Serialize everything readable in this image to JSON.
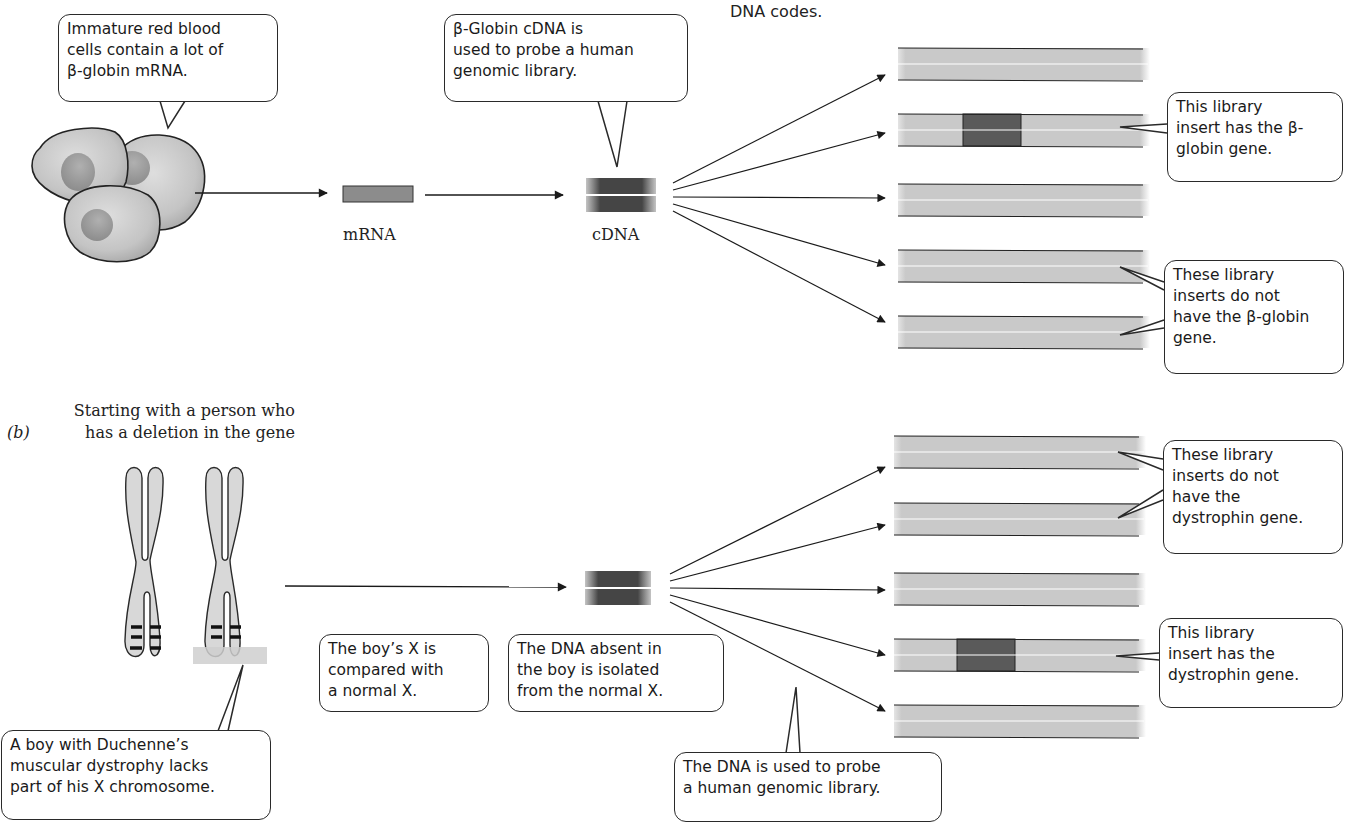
{
  "header": {
    "cut_off_text": "DNA codes."
  },
  "panel_a": {
    "callouts": {
      "red_cells": "Immature red blood\ncells contain a lot of\nβ-globin mRNA.",
      "cdna_probe": "β-Globin cDNA is\nused to probe a human\ngenomic library.",
      "has_gene": "This  library\ninsert has the β-\nglobin gene.",
      "no_gene": "These library\ninserts do not\nhave the β-globin\ngene."
    },
    "labels": {
      "mrna": "mRNA",
      "cdna": "cDNA"
    },
    "library_inserts": [
      {
        "y": 62,
        "has_gene": false
      },
      {
        "y": 130,
        "has_gene": true
      },
      {
        "y": 200,
        "has_gene": false
      },
      {
        "y": 266,
        "has_gene": false
      },
      {
        "y": 332,
        "has_gene": false
      }
    ]
  },
  "panel_b": {
    "label": "(b)",
    "title": "Starting with a person who\nhas a deletion in the gene",
    "callouts": {
      "boy": "A boy with Duchenne’s\nmuscular dystrophy lacks\npart of his X chromosome.",
      "compare": "The boy’s X is\ncompared with\na normal X.",
      "isolated": "The DNA absent in\nthe boy is isolated\nfrom the normal X.",
      "probe": "The DNA is used to probe\na human genomic library.",
      "no_gene": "These library\ninserts do not\nhave the\ndystrophin gene.",
      "has_gene": "This library\ninsert has the\ndystrophin gene."
    },
    "library_inserts": [
      {
        "y": 452,
        "has_gene": false
      },
      {
        "y": 519,
        "has_gene": false
      },
      {
        "y": 589,
        "has_gene": false
      },
      {
        "y": 655,
        "has_gene": true
      },
      {
        "y": 721,
        "has_gene": false
      }
    ]
  },
  "colors": {
    "strip_fill": "#c8c8c8",
    "gene_block": "#5a5a5a",
    "probe_dark": "#4a4a4a",
    "outline": "#2a2a2a",
    "deletion_band": "#cfcfcf"
  }
}
